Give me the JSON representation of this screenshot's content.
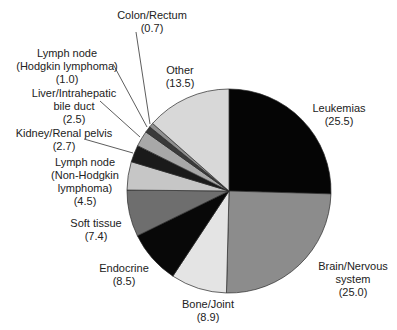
{
  "chart_data": {
    "type": "pie",
    "title": "",
    "start_angle": "12 o'clock",
    "direction": "clockwise",
    "legend": "none (direct labels)",
    "slices": [
      {
        "label": "Leukemias",
        "value": 25.5,
        "color": "#050505"
      },
      {
        "label": "Brain/Nervous system",
        "value": 25.0,
        "color": "#8c8c8c"
      },
      {
        "label": "Bone/Joint",
        "value": 8.9,
        "color": "#e4e4e4"
      },
      {
        "label": "Endocrine",
        "value": 8.5,
        "color": "#080808"
      },
      {
        "label": "Soft tissue",
        "value": 7.4,
        "color": "#6e6e6e"
      },
      {
        "label": "Lymph node (Non-Hodgkin lymphoma)",
        "value": 4.5,
        "color": "#c6c6c6"
      },
      {
        "label": "Kidney/Renal pelvis",
        "value": 2.7,
        "color": "#1a1a1a"
      },
      {
        "label": "Liver/Intrahepatic bile duct",
        "value": 2.5,
        "color": "#a8a8a8"
      },
      {
        "label": "Lymph node (Hodgkin lymphoma)",
        "value": 1.0,
        "color": "#3a3a3a"
      },
      {
        "label": "Colon/Rectum",
        "value": 0.7,
        "color": "#909090"
      },
      {
        "label": "Other",
        "value": 13.5,
        "color": "#d8d8d8"
      }
    ]
  },
  "labels": {
    "colon": {
      "line1": "Colon/Rectum",
      "line2": "(0.7)"
    },
    "hodgkin": {
      "line1": "Lymph node",
      "line2": "(Hodgkin lymphoma)",
      "line3": "(1.0)"
    },
    "liver": {
      "line1": "Liver/Intrahepatic",
      "line2": "bile duct",
      "line3": "(2.5)"
    },
    "kidney": {
      "line1": "Kidney/Renal pelvis",
      "line2": "(2.7)"
    },
    "nhl": {
      "line1": "Lymph node",
      "line2": "(Non-Hodgkin",
      "line3": "lymphoma)",
      "line4": "(4.5)"
    },
    "soft": {
      "line1": "Soft tissue",
      "line2": "(7.4)"
    },
    "endocrine": {
      "line1": "Endocrine",
      "line2": "(8.5)"
    },
    "bone": {
      "line1": "Bone/Joint",
      "line2": "(8.9)"
    },
    "brain": {
      "line1": "Brain/Nervous",
      "line2": "system",
      "line3": "(25.0)"
    },
    "leukemias": {
      "line1": "Leukemias",
      "line2": "(25.5)"
    },
    "other": {
      "line1": "Other",
      "line2": "(13.5)"
    }
  }
}
